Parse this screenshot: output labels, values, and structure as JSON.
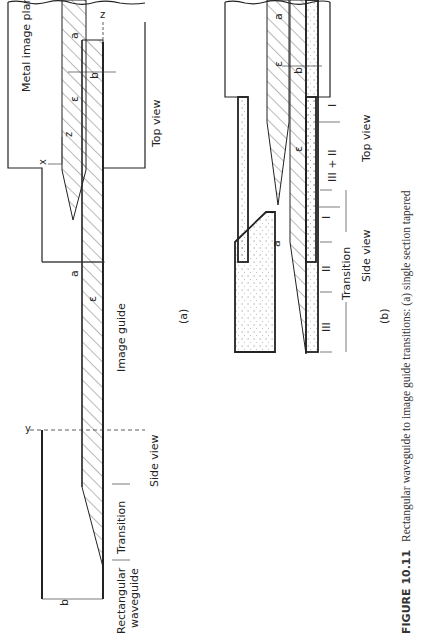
{
  "figure": {
    "caption_label": "FIGURE 10.11",
    "caption_text": "Rectangular waveguide to image guide transitions: (a) single section tapered",
    "panels": [
      {
        "id": "(a)",
        "side_view": {
          "title": "Side view",
          "labels": {
            "axis_y": "y",
            "axis_z": "z",
            "dim_b0": "b",
            "dim_b0_sub": "o",
            "dim_b": "b",
            "eps": "ε",
            "eps_sub": "r",
            "region_rect": "Rectangular",
            "region_rect2": "waveguide",
            "region_transition": "Transition",
            "region_image": "Image guide"
          }
        },
        "top_view": {
          "title": "Top view",
          "labels": {
            "plane": "Metal image plane",
            "dim_a": "a",
            "dim_a0": "a",
            "dim_a0_sub": "o",
            "eps": "ε",
            "eps_sub": "r",
            "axis_x": "x",
            "axis_z": "z"
          }
        }
      },
      {
        "id": "(b)",
        "side_view": {
          "title": "Side view",
          "labels": {
            "dim_b": "b",
            "eps": "ε",
            "eps_sub": "r",
            "sec1": "I",
            "sec2": "II",
            "sec3": "III",
            "transition": "Transition"
          }
        },
        "top_view": {
          "title": "Top view",
          "labels": {
            "dim_a": "a",
            "dim_a0": "a",
            "dim_a0_sub": "o",
            "eps": "ε",
            "eps_sub": "r",
            "sec1": "I",
            "sec23": "III + II"
          }
        }
      }
    ]
  }
}
